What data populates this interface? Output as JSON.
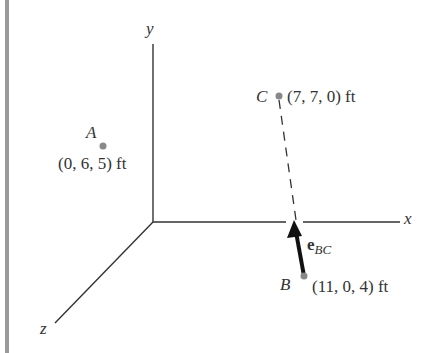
{
  "axes": {
    "x_label": "x",
    "y_label": "y",
    "z_label": "z"
  },
  "points": {
    "A": {
      "name": "A",
      "coords": "(0, 6, 5) ft"
    },
    "B": {
      "name": "B",
      "coords": "(11, 0, 4) ft"
    },
    "C": {
      "name": "C",
      "coords": "(7, 7, 0) ft"
    }
  },
  "vector": {
    "symbol": "e",
    "subscript": "BC"
  },
  "colors": {
    "axis": "#333333",
    "point": "#888888",
    "side_bar": "#9a9a9a",
    "vector": "#111111"
  }
}
